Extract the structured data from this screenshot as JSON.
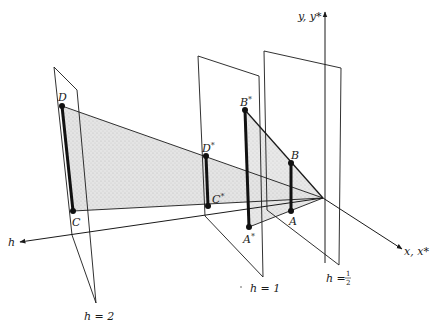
{
  "diagram": {
    "axes": {
      "y_label": "y, y*",
      "x_label": "x, x*",
      "h_label": "h"
    },
    "planes": [
      {
        "id": "h2",
        "label": "h = 2"
      },
      {
        "id": "h1",
        "label": "h = 1"
      },
      {
        "id": "hhalf",
        "label_prefix": "h = ",
        "label_num": "1",
        "label_den": "2"
      }
    ],
    "points": {
      "D": "D",
      "C": "C",
      "D_star": "D",
      "C_star": "C",
      "B_star": "B",
      "A_star": "A",
      "B": "B",
      "A": "A",
      "star": "*"
    },
    "colors": {
      "line": "#1a1a1a",
      "shade": "#d9d9d9",
      "background": "#ffffff"
    }
  }
}
